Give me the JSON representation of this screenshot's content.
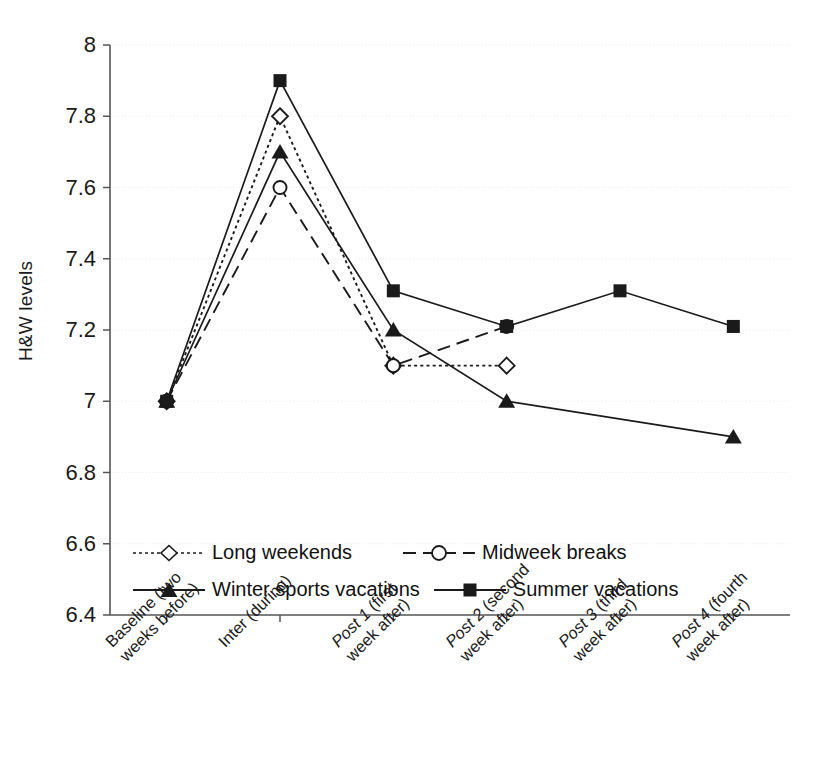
{
  "chart_data": {
    "type": "line",
    "title": "",
    "xlabel": "",
    "ylabel": "H&W levels",
    "ylim": [
      6.4,
      8.0
    ],
    "ytick_step": 0.2,
    "grid": true,
    "legend_position": "inside-bottom-left",
    "yticks": [
      "8",
      "7.8",
      "7.6",
      "7.4",
      "7.2",
      "7",
      "6.8",
      "6.6",
      "6.4"
    ],
    "ytick_values": [
      8,
      7.8,
      7.6,
      7.4,
      7.2,
      7,
      6.8,
      6.6,
      6.4
    ],
    "categories": [
      "Baseline (two weeks before)",
      "Inter (during)",
      "Post 1 (first week after)",
      "Post 2 (second week after)",
      "Post 3 (third week after)",
      "Post 4 (fourth week after)"
    ],
    "category_lines": [
      {
        "italic": "",
        "l1": "Baseline (two",
        "l2": "weeks before)"
      },
      {
        "italic": "",
        "l1": "Inter (during)",
        "l2": ""
      },
      {
        "italic": "Post 1",
        "l1": " (first",
        "l2": "week after)"
      },
      {
        "italic": "Post 2",
        "l1": " (second",
        "l2": "week after)"
      },
      {
        "italic": "Post 3",
        "l1": " (third",
        "l2": "week after)"
      },
      {
        "italic": "Post 4",
        "l1": " (fourth",
        "l2": "week after)"
      }
    ],
    "series": [
      {
        "name": "Long weekends",
        "marker": "open-diamond",
        "line_style": "dotted",
        "color": "#1a1a1a",
        "values": [
          7.0,
          7.8,
          7.1,
          7.1,
          null,
          null
        ]
      },
      {
        "name": "Midweek breaks",
        "marker": "open-circle",
        "line_style": "dashed",
        "color": "#1a1a1a",
        "values": [
          7.0,
          7.6,
          7.1,
          7.21,
          null,
          null
        ]
      },
      {
        "name": "Winter sports vacations",
        "marker": "filled-triangle",
        "line_style": "solid",
        "color": "#1a1a1a",
        "values": [
          7.0,
          7.7,
          7.2,
          7.0,
          null,
          6.9
        ]
      },
      {
        "name": "Summer vacations",
        "marker": "filled-square",
        "line_style": "solid",
        "color": "#1a1a1a",
        "values": [
          7.0,
          7.9,
          7.31,
          7.21,
          7.31,
          7.21
        ]
      }
    ]
  },
  "legend": {
    "entries": [
      {
        "label": "Long weekends"
      },
      {
        "label": "Midweek breaks"
      },
      {
        "label": "Winter sports vacations"
      },
      {
        "label": "Summer vacations"
      }
    ]
  },
  "axis": {
    "y_title": "H&W levels"
  }
}
